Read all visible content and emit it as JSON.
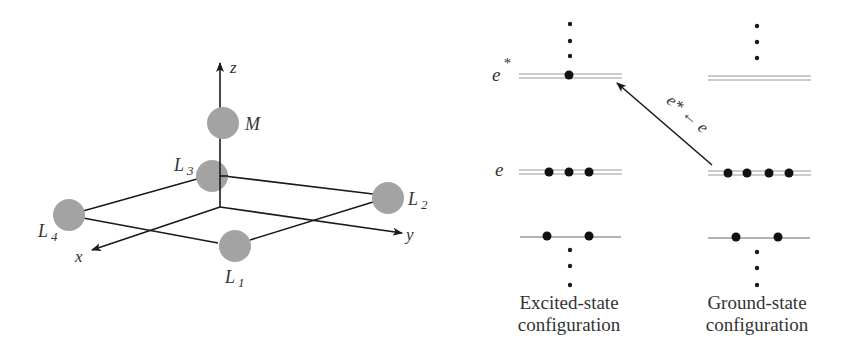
{
  "colors": {
    "ink": "#1a1a1a",
    "atom_fill": "#a3a3a3",
    "level_line": "#9a9a9a",
    "text": "#333333"
  },
  "geometry_diagram": {
    "axes": {
      "x": "x",
      "y": "y",
      "z": "z"
    },
    "metal": "M",
    "ligands": [
      {
        "name": "L",
        "sub": "1"
      },
      {
        "name": "L",
        "sub": "2"
      },
      {
        "name": "L",
        "sub": "3"
      },
      {
        "name": "L",
        "sub": "4"
      }
    ]
  },
  "energy_diagram": {
    "level_labels": {
      "upper": "e",
      "upper_sup": "*",
      "middle": "e"
    },
    "transition_label": "e* ← e",
    "columns": [
      {
        "caption_line1": "Excited-state",
        "caption_line2": "configuration",
        "electrons": {
          "e_star": 1,
          "e": 3,
          "lower": 2
        }
      },
      {
        "caption_line1": "Ground-state",
        "caption_line2": "configuration",
        "electrons": {
          "e_star": 0,
          "e": 4,
          "lower": 2
        }
      }
    ]
  }
}
